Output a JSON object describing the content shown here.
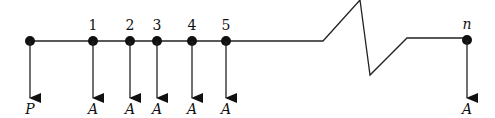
{
  "diagram": {
    "type": "cash-flow timeline",
    "line_color": "#222222",
    "node_color": "#111111",
    "nodes": [
      {
        "x": 30,
        "period_label": "",
        "flow_label": "P"
      },
      {
        "x": 93,
        "period_label": "1",
        "flow_label": "A"
      },
      {
        "x": 130,
        "period_label": "2",
        "flow_label": "A"
      },
      {
        "x": 157,
        "period_label": "3",
        "flow_label": "A"
      },
      {
        "x": 192,
        "period_label": "4",
        "flow_label": "A"
      },
      {
        "x": 226,
        "period_label": "5",
        "flow_label": "A"
      },
      {
        "x": 467,
        "period_label": "n",
        "flow_label": "A"
      }
    ],
    "break_symbol": "zigzag"
  }
}
